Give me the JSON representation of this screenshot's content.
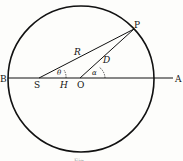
{
  "diagram": {
    "points": {
      "P": "P",
      "A": "A",
      "B": "B",
      "S": "S",
      "O": "O"
    },
    "segments": {
      "R": "R",
      "D": "D",
      "H": "H"
    },
    "angles": {
      "theta": "θ",
      "alpha": "α"
    },
    "caption": "Fig."
  }
}
